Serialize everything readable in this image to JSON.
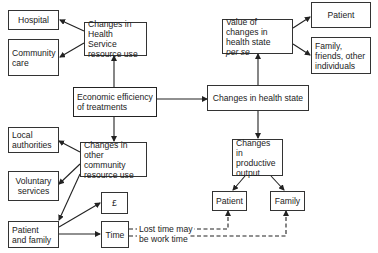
{
  "diagram": {
    "nodes": {
      "hospital": "Hospital",
      "community_care": "Community care",
      "health_service": "Changes in Health Service resource use",
      "economic_efficiency": "Economic efficiency of treatments",
      "health_state": "Changes in health state",
      "value_changes_line1": "Value of changes in health state",
      "value_changes_line2": "per se",
      "patient_top": "Patient",
      "family_friends": "Family, friends, other individuals",
      "local_authorities": "Local authorities",
      "other_community": "Changes in other community resource use",
      "voluntary_services": "Voluntary services",
      "pound": "£",
      "patient_and_family": "Patient and family",
      "time": "Time",
      "productive_output": "Changes in productive output",
      "patient_bottom": "Patient",
      "family_bottom": "Family"
    },
    "annotations": {
      "lost_time_line1": "Lost time may",
      "lost_time_line2": "be work time"
    },
    "edges": [
      {
        "from": "economic_efficiency",
        "to": "health_service",
        "style": "solid"
      },
      {
        "from": "health_service",
        "to": "hospital",
        "style": "solid"
      },
      {
        "from": "health_service",
        "to": "community_care",
        "style": "solid"
      },
      {
        "from": "economic_efficiency",
        "to": "health_state",
        "style": "solid"
      },
      {
        "from": "health_state",
        "to": "value_changes",
        "style": "solid"
      },
      {
        "from": "value_changes",
        "to": "patient_top",
        "style": "solid"
      },
      {
        "from": "value_changes",
        "to": "family_friends",
        "style": "solid"
      },
      {
        "from": "economic_efficiency",
        "to": "other_community",
        "style": "solid"
      },
      {
        "from": "other_community",
        "to": "local_authorities",
        "style": "solid"
      },
      {
        "from": "other_community",
        "to": "voluntary_services",
        "style": "solid"
      },
      {
        "from": "other_community",
        "to": "patient_and_family",
        "style": "solid"
      },
      {
        "from": "patient_and_family",
        "to": "pound",
        "style": "solid"
      },
      {
        "from": "patient_and_family",
        "to": "time",
        "style": "solid"
      },
      {
        "from": "health_state",
        "to": "productive_output",
        "style": "solid"
      },
      {
        "from": "productive_output",
        "to": "patient_bottom",
        "style": "solid"
      },
      {
        "from": "productive_output",
        "to": "family_bottom",
        "style": "solid"
      },
      {
        "from": "time",
        "to": "patient_bottom",
        "style": "dashed"
      },
      {
        "from": "time",
        "to": "family_bottom",
        "style": "dashed"
      }
    ]
  }
}
